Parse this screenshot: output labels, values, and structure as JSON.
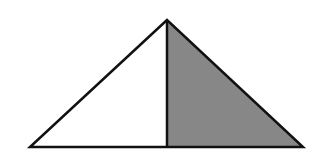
{
  "diagram": {
    "type": "triangle-split",
    "background": "#ffffff",
    "stroke_color": "#111111",
    "fill_left": "#ffffff",
    "fill_right": "#878787",
    "points": {
      "apex": [
        167,
        20
      ],
      "base_left": [
        30,
        147
      ],
      "base_right": [
        303,
        147
      ],
      "foot": [
        167,
        147
      ]
    }
  }
}
